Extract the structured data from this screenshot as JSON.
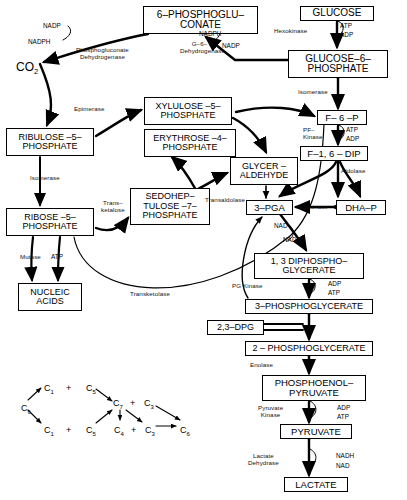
{
  "diagram": {
    "type": "metabolic-pathway-diagram",
    "line_color": "#000000",
    "background": "#ffffff"
  },
  "metabolites": [
    {
      "id": "glucose",
      "label": "GLUCOSE",
      "x": 300,
      "y": 6,
      "w": 74,
      "h": 15,
      "font": 10
    },
    {
      "id": "g6p",
      "label": "GLUCOSE–6–\nPHOSPHATE",
      "x": 288,
      "y": 50,
      "w": 100,
      "h": 28,
      "font": 10
    },
    {
      "id": "pgluconate",
      "label": "6–PHOSPHOGLU–\nCONATE",
      "x": 143,
      "y": 6,
      "w": 115,
      "h": 28,
      "font": 10
    },
    {
      "id": "f6p",
      "label": "F– 6 –P",
      "x": 317,
      "y": 110,
      "w": 50,
      "h": 15,
      "font": 9.5
    },
    {
      "id": "f16dip",
      "label": "F–1, 6 – DIP",
      "x": 300,
      "y": 146,
      "w": 68,
      "h": 15,
      "font": 9.5
    },
    {
      "id": "ribulose5p",
      "label": "RIBULOSE –5–\nPHOSPHATE",
      "x": 6,
      "y": 128,
      "w": 88,
      "h": 28,
      "font": 9
    },
    {
      "id": "xylulose5p",
      "label": "XYLULOSE –5–\nPHOSPHATE",
      "x": 144,
      "y": 97,
      "w": 88,
      "h": 28,
      "font": 9
    },
    {
      "id": "erythrose4p",
      "label": "ERYTHROSE –4–\nPHOSPHATE",
      "x": 144,
      "y": 129,
      "w": 92,
      "h": 28,
      "font": 9
    },
    {
      "id": "glyceraldehyde",
      "label": "GLYCER –\nALDEHYDE",
      "x": 230,
      "y": 157,
      "w": 68,
      "h": 28,
      "font": 9
    },
    {
      "id": "ribose5p",
      "label": "RIBOSE –5–\nPHOSPHATE",
      "x": 6,
      "y": 208,
      "w": 88,
      "h": 28,
      "font": 9
    },
    {
      "id": "sedoheptulose7p",
      "label": "SEDOHEP–\nTULOSE –7–\nPHOSPHATE",
      "x": 130,
      "y": 188,
      "w": 80,
      "h": 37,
      "font": 9
    },
    {
      "id": "pga3",
      "label": "3–PGA",
      "x": 246,
      "y": 200,
      "w": 47,
      "h": 15,
      "font": 9.5
    },
    {
      "id": "dhap",
      "label": "DHA–P",
      "x": 336,
      "y": 200,
      "w": 50,
      "h": 15,
      "font": 9.5
    },
    {
      "id": "nucleic",
      "label": "NUCLEIC\nACIDS",
      "x": 18,
      "y": 283,
      "w": 64,
      "h": 28,
      "font": 9
    },
    {
      "id": "dipho13",
      "label": "1, 3 DIPHOSPHO–\nGLYCERATE",
      "x": 254,
      "y": 253,
      "w": 110,
      "h": 26,
      "font": 9
    },
    {
      "id": "pg3",
      "label": "3–PHOSPHOGLYCERATE",
      "x": 245,
      "y": 299,
      "w": 128,
      "h": 15,
      "font": 9
    },
    {
      "id": "dpg23",
      "label": "2,3–DPG",
      "x": 207,
      "y": 320,
      "w": 57,
      "h": 15,
      "font": 9
    },
    {
      "id": "pg2",
      "label": "2 – PHOSPHOGLYCERATE",
      "x": 245,
      "y": 341,
      "w": 128,
      "h": 15,
      "font": 9
    },
    {
      "id": "pep",
      "label": "PHOSPHOENOL–\nPYRUVATE",
      "x": 262,
      "y": 375,
      "w": 104,
      "h": 26,
      "font": 9.5
    },
    {
      "id": "pyruvate",
      "label": "PYRUVATE",
      "x": 280,
      "y": 424,
      "w": 72,
      "h": 15,
      "font": 9.5
    },
    {
      "id": "lactate",
      "label": "LACTATE",
      "x": 284,
      "y": 477,
      "w": 64,
      "h": 15,
      "font": 9.5
    }
  ],
  "enzymes": [
    {
      "id": "hexokinase",
      "label": "Hexokinase",
      "x": 274,
      "y": 27
    },
    {
      "id": "g6p-dehydrogenase",
      "label": "G–6– P\nDehydrogenase",
      "x": 180,
      "y": 40
    },
    {
      "id": "pgluconate-dehydrogenase",
      "label": "Phosphogluconate\nDehydrogenase",
      "x": 76,
      "y": 46
    },
    {
      "id": "isomerase-g6p",
      "label": "Isomerase",
      "x": 298,
      "y": 88
    },
    {
      "id": "epimerase",
      "label": "Epimerase",
      "x": 74,
      "y": 105
    },
    {
      "id": "pf-kinase",
      "label": "PF–\nKinase",
      "x": 303,
      "y": 126
    },
    {
      "id": "aldolase",
      "label": "Aldolase",
      "x": 341,
      "y": 167
    },
    {
      "id": "isomerase-ribose",
      "label": "Isomerase",
      "x": 30,
      "y": 174
    },
    {
      "id": "transketolase-sedo",
      "label": "Trans–\nketalose",
      "x": 101,
      "y": 199
    },
    {
      "id": "transaldolase",
      "label": "Transaldolase",
      "x": 205,
      "y": 196
    },
    {
      "id": "isomerase-dhap",
      "label": "Isomerase",
      "x": 298,
      "y": 203
    },
    {
      "id": "mutase",
      "label": "Mutase",
      "x": 20,
      "y": 253
    },
    {
      "id": "transketolase-main",
      "label": "Transketolase",
      "x": 130,
      "y": 290
    },
    {
      "id": "pg-kinase",
      "label": "PG Kinase",
      "x": 232,
      "y": 282
    },
    {
      "id": "enolase",
      "label": "Enolase",
      "x": 250,
      "y": 361
    },
    {
      "id": "pyruvate-kinase",
      "label": "Pyruvate\nKinase",
      "x": 258,
      "y": 404
    },
    {
      "id": "lactate-dehydrase",
      "label": "Lactate\nDehydrase",
      "x": 248,
      "y": 452
    }
  ],
  "cofactors": [
    {
      "id": "atp-hexokinase",
      "label": "ATP",
      "x": 340,
      "y": 22
    },
    {
      "id": "adp-hexokinase",
      "label": "ADP",
      "x": 340,
      "y": 31
    },
    {
      "id": "nadp-top",
      "label": "NADP",
      "x": 43,
      "y": 22
    },
    {
      "id": "nadph-top",
      "label": "NADPH",
      "x": 28,
      "y": 38
    },
    {
      "id": "nadph-right",
      "label": "NADPH",
      "x": 199,
      "y": 30
    },
    {
      "id": "nadp-right",
      "label": "NADP",
      "x": 222,
      "y": 42
    },
    {
      "id": "atp-pfk",
      "label": "ATP",
      "x": 346,
      "y": 126
    },
    {
      "id": "adp-pfk",
      "label": "ADP",
      "x": 346,
      "y": 135
    },
    {
      "id": "atp-ribose",
      "label": "ATP",
      "x": 51,
      "y": 253
    },
    {
      "id": "nad-gapdh",
      "label": "NAD",
      "x": 274,
      "y": 222
    },
    {
      "id": "nadh-gapdh",
      "label": "NADH",
      "x": 283,
      "y": 236
    },
    {
      "id": "adp-pgk",
      "label": "ADP",
      "x": 328,
      "y": 280
    },
    {
      "id": "atp-pgk",
      "label": "ATP",
      "x": 328,
      "y": 289
    },
    {
      "id": "adp-pk",
      "label": "ADP",
      "x": 337,
      "y": 404
    },
    {
      "id": "atp-pk",
      "label": "ATP",
      "x": 337,
      "y": 413
    },
    {
      "id": "nadh-ldh",
      "label": "NADH",
      "x": 336,
      "y": 452
    },
    {
      "id": "nad-ldh",
      "label": "NAD",
      "x": 336,
      "y": 462
    }
  ],
  "co2": {
    "label": "CO",
    "sub": "2",
    "x": 16,
    "y": 60
  },
  "carbon_scheme": {
    "nodes": [
      {
        "id": "c6-left",
        "label": "C",
        "sub": "6",
        "x": 21,
        "y": 403
      },
      {
        "id": "c1-upper",
        "label": "C",
        "sub": "1",
        "x": 44,
        "y": 383
      },
      {
        "id": "c1-lower",
        "label": "C",
        "sub": "1",
        "x": 44,
        "y": 425
      },
      {
        "id": "plus-1",
        "label": "+",
        "sub": "",
        "x": 66,
        "y": 383
      },
      {
        "id": "plus-2",
        "label": "+",
        "sub": "",
        "x": 66,
        "y": 425
      },
      {
        "id": "c5-upper",
        "label": "C",
        "sub": "5",
        "x": 86,
        "y": 383
      },
      {
        "id": "c5-lower",
        "label": "C",
        "sub": "5",
        "x": 86,
        "y": 425
      },
      {
        "id": "c7",
        "label": "C",
        "sub": "7",
        "x": 117,
        "y": 404
      },
      {
        "id": "plus-3",
        "label": "+",
        "sub": "",
        "x": 133,
        "y": 404
      },
      {
        "id": "c3-upper",
        "label": "C",
        "sub": "3",
        "x": 146,
        "y": 404
      },
      {
        "id": "c4",
        "label": "C",
        "sub": "4",
        "x": 117,
        "y": 425
      },
      {
        "id": "plus-4",
        "label": "+",
        "sub": "",
        "x": 133,
        "y": 425
      },
      {
        "id": "c3-lower",
        "label": "C",
        "sub": "3",
        "x": 146,
        "y": 425
      },
      {
        "id": "c6-right",
        "label": "C",
        "sub": "6",
        "x": 180,
        "y": 425
      }
    ]
  }
}
